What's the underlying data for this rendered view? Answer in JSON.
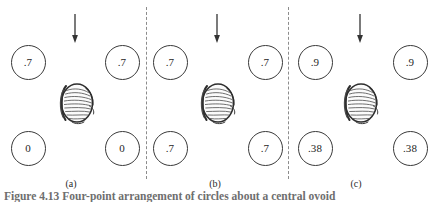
{
  "figure": {
    "width": 437,
    "height": 202,
    "background": "#ffffff",
    "ink_color": "#3a3a3a",
    "divider_color": "#8c8c8c",
    "caption_text": "Figure 4.13   Four-point arrangement of circles about a central ovoid",
    "caption_label": "Figure 4.13"
  },
  "dividers": [
    {
      "name": "divider-1",
      "x": 146
    },
    {
      "name": "divider-2",
      "x": 288
    }
  ],
  "panels": [
    {
      "id": "a",
      "label": "(a)",
      "label_x": 71,
      "arrow": {
        "x": 75,
        "y": 14,
        "direction": "down"
      },
      "ovoid": {
        "x": 76,
        "y": 103
      },
      "circles": [
        {
          "position": "top-left",
          "x": 28,
          "y": 62,
          "value": ".7"
        },
        {
          "position": "top-right",
          "x": 122,
          "y": 62,
          "value": ".7"
        },
        {
          "position": "bottom-left",
          "x": 28,
          "y": 148,
          "value": "0"
        },
        {
          "position": "bottom-right",
          "x": 122,
          "y": 148,
          "value": "0"
        }
      ]
    },
    {
      "id": "b",
      "label": "(b)",
      "label_x": 215,
      "arrow": {
        "x": 217,
        "y": 14,
        "direction": "down"
      },
      "ovoid": {
        "x": 217,
        "y": 103
      },
      "circles": [
        {
          "position": "top-left",
          "x": 170,
          "y": 62,
          "value": ".7"
        },
        {
          "position": "top-right",
          "x": 265,
          "y": 62,
          "value": ".7"
        },
        {
          "position": "bottom-left",
          "x": 170,
          "y": 148,
          "value": ".7"
        },
        {
          "position": "bottom-right",
          "x": 265,
          "y": 148,
          "value": ".7"
        }
      ]
    },
    {
      "id": "c",
      "label": "(c)",
      "label_x": 356,
      "arrow": {
        "x": 360,
        "y": 14,
        "direction": "down"
      },
      "ovoid": {
        "x": 360,
        "y": 103
      },
      "circles": [
        {
          "position": "top-left",
          "x": 315,
          "y": 62,
          "value": ".9"
        },
        {
          "position": "top-right",
          "x": 410,
          "y": 62,
          "value": ".9"
        },
        {
          "position": "bottom-left",
          "x": 315,
          "y": 148,
          "value": ".38"
        },
        {
          "position": "bottom-right",
          "x": 410,
          "y": 148,
          "value": ".38"
        }
      ]
    }
  ]
}
